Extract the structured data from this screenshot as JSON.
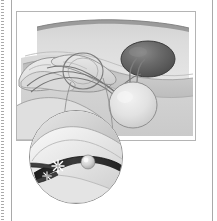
{
  "page": {
    "background_color": "#ffffff",
    "width": 217,
    "height": 221
  },
  "furniture": {
    "perforation_label": "perforated tear-off edge",
    "perforation_color": "#9a9a9a",
    "left_rule_label": "page margin rule",
    "right_rule_label": "page margin rule",
    "rule_color": "#a9a9a9"
  },
  "figure": {
    "panel_label": "surgical procedure illustration",
    "border_color": "#b4b4b4",
    "background_color": "#ffffff",
    "palette": {
      "skin_light": "#e3e3e3",
      "skin_mid": "#cfcfcf",
      "skin_shadow": "#b6b6b6",
      "tissue_band": "#c4c4c4",
      "tissue_band_dark": "#ababab",
      "organ_dark": "#6d6d6d",
      "organ_dark_edge": "#4a4a4a",
      "organ_pale": "#e8e8e8",
      "outline": "#6f6f6f",
      "cord_line": "#7a7a7a",
      "highlight": "#ffffff"
    },
    "elements": [
      {
        "name": "skin-surface",
        "label": "abdominal skin surface"
      },
      {
        "name": "tissue-band",
        "label": "subcutaneous tissue band"
      },
      {
        "name": "dark-organ",
        "label": "dark ovoid organ"
      },
      {
        "name": "hand",
        "label": "gloved hand and fingers"
      },
      {
        "name": "loop-ring",
        "label": "ring forceps loop"
      },
      {
        "name": "cord",
        "label": "spermatic cord"
      },
      {
        "name": "pale-organ",
        "label": "pale spherical organ"
      },
      {
        "name": "leader-line",
        "label": "magnification leader line"
      }
    ]
  },
  "inset": {
    "label": "magnified detail of cauterization",
    "border_color": "#8e8e8e",
    "background_color": "#efefef",
    "palette": {
      "field_light": "#f2f2f2",
      "field_mid": "#d8d8d8",
      "field_shadow": "#bdbdbd",
      "vessel_dark": "#2b2b2b",
      "vessel_edge": "#111111",
      "instrument": "#3a3a3a",
      "nodule": "#d6d6d6",
      "spark": "#ffffff"
    },
    "elements": [
      {
        "name": "vessel",
        "label": "dark vessel segment"
      },
      {
        "name": "instrument-tip",
        "label": "cautery instrument tip"
      },
      {
        "name": "spark-burst",
        "label": "energy spark burst"
      },
      {
        "name": "nodule",
        "label": "pale nodule on vessel"
      }
    ]
  }
}
